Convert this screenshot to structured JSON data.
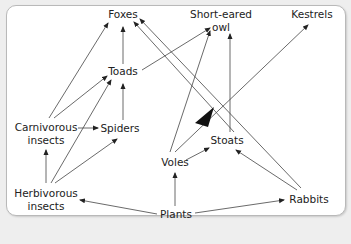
{
  "diagram": {
    "type": "food-web",
    "nodes": [
      {
        "id": "foxes",
        "label": "Foxes",
        "line1": "Foxes",
        "line2": ""
      },
      {
        "id": "owl",
        "label": "Short-eared owl",
        "line1": "Short-eared",
        "line2": "owl"
      },
      {
        "id": "kestrels",
        "label": "Kestrels",
        "line1": "Kestrels",
        "line2": ""
      },
      {
        "id": "toads",
        "label": "Toads",
        "line1": "Toads",
        "line2": ""
      },
      {
        "id": "carnivorous_insects",
        "label": "Carnivorous insects",
        "line1": "Carnivorous",
        "line2": "insects"
      },
      {
        "id": "spiders",
        "label": "Spiders",
        "line1": "Spiders",
        "line2": ""
      },
      {
        "id": "voles",
        "label": "Voles",
        "line1": "Voles",
        "line2": ""
      },
      {
        "id": "stoats",
        "label": "Stoats",
        "line1": "Stoats",
        "line2": ""
      },
      {
        "id": "herbivorous_insects",
        "label": "Herbivorous insects",
        "line1": "Herbivorous",
        "line2": "insects"
      },
      {
        "id": "plants",
        "label": "Plants",
        "line1": "Plants",
        "line2": ""
      },
      {
        "id": "rabbits",
        "label": "Rabbits",
        "line1": "Rabbits",
        "line2": ""
      }
    ],
    "edges": [
      {
        "from": "Toads",
        "to": "Foxes"
      },
      {
        "from": "Toads",
        "to": "Short-eared owl"
      },
      {
        "from": "Carnivorous insects",
        "to": "Foxes"
      },
      {
        "from": "Carnivorous insects",
        "to": "Toads"
      },
      {
        "from": "Carnivorous insects",
        "to": "Spiders"
      },
      {
        "from": "Spiders",
        "to": "Toads"
      },
      {
        "from": "Herbivorous insects",
        "to": "Carnivorous insects"
      },
      {
        "from": "Herbivorous insects",
        "to": "Toads"
      },
      {
        "from": "Herbivorous insects",
        "to": "Spiders"
      },
      {
        "from": "Voles",
        "to": "Short-eared owl"
      },
      {
        "from": "Voles",
        "to": "Kestrels"
      },
      {
        "from": "Voles",
        "to": "Stoats"
      },
      {
        "from": "Stoats",
        "to": "Foxes"
      },
      {
        "from": "Stoats",
        "to": "Short-eared owl"
      },
      {
        "from": "Rabbits",
        "to": "Foxes"
      },
      {
        "from": "Rabbits",
        "to": "Stoats"
      },
      {
        "from": "Plants",
        "to": "Herbivorous insects"
      },
      {
        "from": "Plants",
        "to": "Voles"
      },
      {
        "from": "Plants",
        "to": "Rabbits"
      }
    ],
    "colors": {
      "background": "#eeeeee",
      "panel": "#ffffff",
      "line": "#3a3a3a",
      "text": "#222222"
    }
  }
}
